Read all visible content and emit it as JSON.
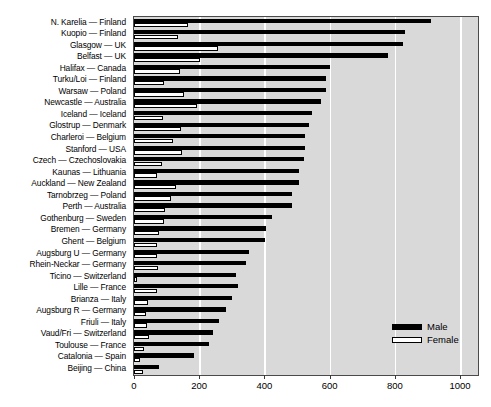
{
  "chart_data": {
    "type": "bar",
    "orientation": "horizontal",
    "title": "",
    "subtitle": "",
    "xlabel": "",
    "ylabel": "",
    "xlim": [
      0,
      1055
    ],
    "xticks": [
      0,
      200,
      400,
      600,
      800,
      1000
    ],
    "xtick_labels": [
      "0",
      "200",
      "400",
      "600",
      "800",
      "1000"
    ],
    "grid": "vertical-white",
    "legend_position": "bottom-right",
    "colors": {
      "male": "#000000",
      "female": "#ffffff",
      "female_edge": "#000000",
      "plot_background": "#d9d9d9",
      "gridline": "#ffffff",
      "axis": "#4a4a4a",
      "text": "#000000",
      "page_background": "#ffffff"
    },
    "categories": [
      "N. Karelia — Finland",
      "Kuopio — Finland",
      "Glasgow — UK",
      "Belfast — UK",
      "Halifax — Canada",
      "Turku/Loi — Finland",
      "Warsaw — Poland",
      "Newcastle — Australia",
      "Iceland — Iceland",
      "Glostrup — Denmark",
      "Charleroi — Belgium",
      "Stanford — USA",
      "Czech — Czechoslovakia",
      "Kaunas — Lithuania",
      "Auckland — New Zealand",
      "Tarnobrzeg — Poland",
      "Perth — Australia",
      "Gothenburg — Sweden",
      "Bremen — Germany",
      "Ghent — Belgium",
      "Augsburg U — Germany",
      "Rhein-Neckar — Germany",
      "Ticino — Switzerland",
      "Lille — France",
      "Brianza — Italy",
      "Augsburg R — Germany",
      "Friuli — Italy",
      "Vaud/Fri — Switzerland",
      "Toulouse — France",
      "Catalonia — Spain",
      "Beijing — China"
    ],
    "series": [
      {
        "name": "Male",
        "values": [
          912,
          830,
          825,
          780,
          601,
          590,
          588,
          573,
          545,
          536,
          524,
          524,
          520,
          507,
          505,
          486,
          484,
          424,
          405,
          403,
          352,
          342,
          313,
          318,
          300,
          283,
          260,
          241,
          231,
          183,
          77
        ]
      },
      {
        "name": "Female",
        "values": [
          166,
          135,
          258,
          202,
          140,
          92,
          152,
          192,
          88,
          144,
          120,
          147,
          85,
          72,
          128,
          112,
          95,
          92,
          78,
          72,
          72,
          74,
          8,
          70,
          44,
          37,
          41,
          47,
          32,
          19,
          29
        ]
      }
    ]
  },
  "legend": {
    "items": [
      {
        "label": "Male",
        "swatch": "filled-black"
      },
      {
        "label": "Female",
        "swatch": "outline-white"
      }
    ]
  }
}
